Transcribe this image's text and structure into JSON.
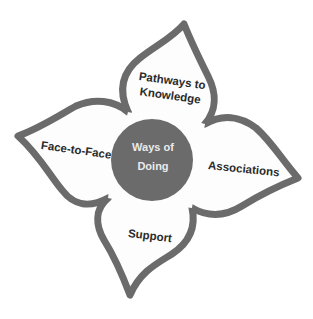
{
  "diagram": {
    "type": "four-petal flower",
    "center": {
      "label_line1": "Ways of",
      "label_line2": "Doing",
      "color": "#6b6b6b",
      "text_color": "#eaeaea"
    },
    "petals": [
      {
        "position": "top",
        "label_line1": "Pathways to",
        "label_line2": "Knowledge"
      },
      {
        "position": "left",
        "label": "Face-to-Face"
      },
      {
        "position": "right",
        "label": "Associations"
      },
      {
        "position": "bottom",
        "label": "Support"
      }
    ],
    "outline_color": "#6b6b6b",
    "background_color": "#ffffff"
  }
}
